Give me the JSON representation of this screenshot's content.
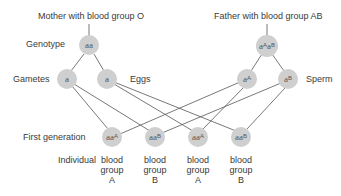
{
  "parents": {
    "mother": {
      "title": "Mother with blood group O",
      "genotype": {
        "base": "aa",
        "sup": ""
      }
    },
    "father": {
      "title": "Father with blood group AB",
      "genotype": {
        "parts": [
          {
            "base": "a",
            "sup": "A"
          },
          {
            "base": "a",
            "sup": "B"
          }
        ]
      }
    }
  },
  "row_labels": {
    "genotype": "Genotype",
    "gametes": "Gametes",
    "eggs": "Eggs",
    "sperm": "Sperm",
    "first_generation": "First generation",
    "individual": "Individual"
  },
  "gametes": {
    "mother": [
      {
        "base": "a",
        "sup": ""
      },
      {
        "base": "a",
        "sup": ""
      }
    ],
    "father": [
      {
        "base": "a",
        "sup": "A"
      },
      {
        "base": "a",
        "sup": "B"
      }
    ]
  },
  "offspring": [
    {
      "base": "aa",
      "sup": "A",
      "phenotype": [
        "blood",
        "group",
        "A"
      ]
    },
    {
      "base": "aa",
      "sup": "B",
      "phenotype": [
        "blood",
        "group",
        "B"
      ]
    },
    {
      "base": "aa",
      "sup": "A",
      "phenotype": [
        "blood",
        "group",
        "A"
      ]
    },
    {
      "base": "aa",
      "sup": "B",
      "phenotype": [
        "blood",
        "group",
        "B"
      ]
    }
  ],
  "colors": {
    "node_fill": "#cfcfcf",
    "line": "#555555",
    "text": "#3a3a3a"
  }
}
